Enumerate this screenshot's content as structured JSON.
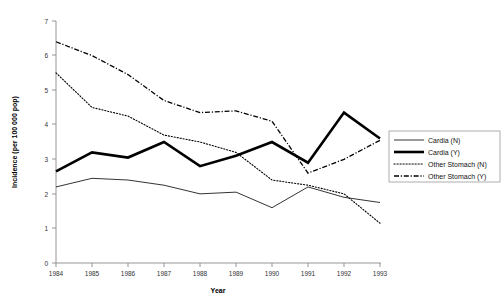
{
  "chart_data": {
    "type": "line",
    "title": "",
    "xlabel": "Year",
    "ylabel": "Incidence (per 100 000 pop)",
    "x": [
      1984,
      1985,
      1986,
      1987,
      1988,
      1989,
      1990,
      1991,
      1992,
      1993
    ],
    "xtick_labels": [
      "1984",
      "1985",
      "1986",
      "1987",
      "1988",
      "1989",
      "1990",
      "1991",
      "1992",
      "1993"
    ],
    "ytick_labels": [
      "0",
      "1",
      "2",
      "3",
      "4",
      "5",
      "6",
      "7"
    ],
    "ylim": [
      0,
      7
    ],
    "xlim": [
      1984,
      1993
    ],
    "grid": false,
    "legend_position": "right",
    "series": [
      {
        "name": "Cardia (N)",
        "style": "thin-solid",
        "values": [
          2.2,
          2.45,
          2.4,
          2.25,
          2.0,
          2.05,
          1.6,
          2.2,
          1.9,
          1.75
        ]
      },
      {
        "name": "Cardia (Y)",
        "style": "thick-solid",
        "values": [
          2.65,
          3.2,
          3.05,
          3.5,
          2.8,
          3.1,
          3.5,
          2.9,
          4.35,
          3.6
        ]
      },
      {
        "name": "Other Stomach (N)",
        "style": "dotted",
        "values": [
          5.5,
          4.5,
          4.25,
          3.7,
          3.5,
          3.2,
          2.4,
          2.25,
          2.0,
          1.15
        ]
      },
      {
        "name": "Other Stomach (Y)",
        "style": "dash-dot",
        "values": [
          6.4,
          6.0,
          5.45,
          4.7,
          4.35,
          4.4,
          4.1,
          2.6,
          3.0,
          3.55
        ]
      }
    ]
  },
  "axes": {
    "x_title": "Year",
    "y_title": "Incidence (per 100 000 pop)",
    "y_ticks": [
      "7",
      "6",
      "5",
      "4",
      "3",
      "2",
      "1",
      "0"
    ],
    "x_ticks": [
      "1984",
      "1985",
      "1986",
      "1987",
      "1988",
      "1989",
      "1990",
      "1991",
      "1992",
      "1993"
    ]
  },
  "legend": {
    "entries": [
      {
        "label": "Cardia (N)"
      },
      {
        "label": "Cardia (Y)"
      },
      {
        "label": "Other Stomach (N)"
      },
      {
        "label": "Other Stomach (Y)"
      }
    ]
  },
  "colors": {
    "line": "#000000",
    "axis": "#8a8a8a",
    "background": "#ffffff"
  }
}
